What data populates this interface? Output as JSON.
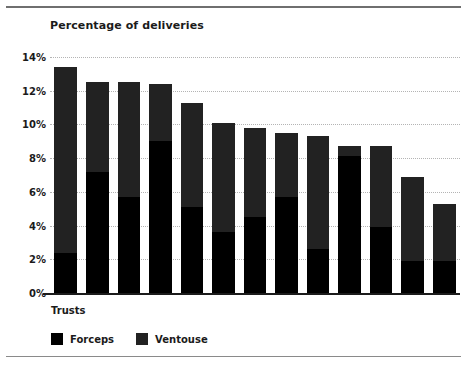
{
  "chart_data": {
    "type": "bar",
    "subtype": "stacked-bar",
    "title": "Percentage of deliveries",
    "xlabel": "Trusts",
    "ylabel": "",
    "ylim": [
      0,
      14
    ],
    "ytick_labels": [
      "14%",
      "12%",
      "10%",
      "8%",
      "6%",
      "4%",
      "2%",
      "0%"
    ],
    "ytick_values": [
      14,
      12,
      10,
      8,
      6,
      4,
      2,
      0
    ],
    "grid": true,
    "grid_style": "dotted-horizontal",
    "legend_position": "bottom-left",
    "categories": [
      "",
      "",
      "",
      "",
      "",
      "",
      "",
      "",
      "",
      "",
      "",
      "",
      ""
    ],
    "series": [
      {
        "name": "Forceps",
        "color": "#000000",
        "values": [
          2.4,
          7.2,
          5.7,
          9.0,
          5.1,
          3.6,
          4.5,
          5.7,
          2.6,
          8.1,
          3.9,
          1.9,
          1.9
        ]
      },
      {
        "name": "Ventouse",
        "color": "#222222",
        "values": [
          11.0,
          5.3,
          6.8,
          3.4,
          6.2,
          6.5,
          5.3,
          3.8,
          6.7,
          0.6,
          4.8,
          5.0,
          3.4
        ]
      }
    ],
    "totals": [
      13.4,
      12.5,
      12.5,
      12.4,
      11.3,
      10.1,
      9.8,
      9.5,
      9.3,
      8.7,
      8.7,
      6.9,
      5.3
    ]
  },
  "legend": {
    "items": [
      {
        "label": "Forceps",
        "color": "#000000"
      },
      {
        "label": "Ventouse",
        "color": "#222222"
      }
    ]
  }
}
